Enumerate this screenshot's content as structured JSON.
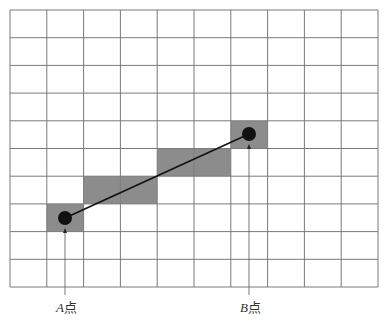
{
  "diagram": {
    "title": "",
    "grid": {
      "cols": 10,
      "rows": 10,
      "left": 10,
      "top": 10,
      "cell_w": 36.8,
      "cell_h": 27.7,
      "line_color": "#7a7a7a",
      "fill_color": "#8c8c8c"
    },
    "shaded_cells": [
      {
        "col": 1,
        "row": 7
      },
      {
        "col": 2,
        "row": 6
      },
      {
        "col": 3,
        "row": 6
      },
      {
        "col": 4,
        "row": 5
      },
      {
        "col": 5,
        "row": 5
      },
      {
        "col": 6,
        "row": 4
      }
    ],
    "points": {
      "A": {
        "x": 65,
        "y": 218,
        "letter": "A",
        "suffix": "点"
      },
      "B": {
        "x": 249,
        "y": 134,
        "letter": "B",
        "suffix": "点"
      }
    },
    "segment": {
      "from": "A",
      "to": "B",
      "color": "#111111"
    },
    "point_color": "#111111"
  }
}
